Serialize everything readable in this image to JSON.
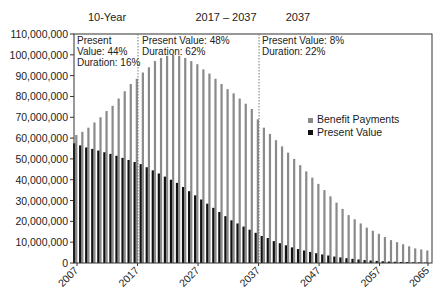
{
  "chart_data": {
    "type": "bar",
    "title": "",
    "xlabel": "",
    "ylabel": "",
    "ylim": [
      0,
      110000000
    ],
    "yticks": [
      0,
      10000000,
      20000000,
      30000000,
      40000000,
      50000000,
      60000000,
      70000000,
      80000000,
      90000000,
      100000000,
      110000000
    ],
    "ytick_labels": [
      "0",
      "10,000,000",
      "20,000,000",
      "30,000,000",
      "40,000,000",
      "50,000,000",
      "60,000,000",
      "70,000,000",
      "80,000,000",
      "90,000,000",
      "100,000,000",
      "110,000,000"
    ],
    "xtick_labels": [
      "2007",
      "2017",
      "2027",
      "2037",
      "2047",
      "2057",
      "2065"
    ],
    "grid": false,
    "legend_position": "right-middle",
    "categories": [
      2007,
      2008,
      2009,
      2010,
      2011,
      2012,
      2013,
      2014,
      2015,
      2016,
      2017,
      2018,
      2019,
      2020,
      2021,
      2022,
      2023,
      2024,
      2025,
      2026,
      2027,
      2028,
      2029,
      2030,
      2031,
      2032,
      2033,
      2034,
      2035,
      2036,
      2037,
      2038,
      2039,
      2040,
      2041,
      2042,
      2043,
      2044,
      2045,
      2046,
      2047,
      2048,
      2049,
      2050,
      2051,
      2052,
      2053,
      2054,
      2055,
      2056,
      2057,
      2058,
      2059,
      2060,
      2061,
      2062,
      2063,
      2064,
      2065
    ],
    "series": [
      {
        "name": "Benefit Payments",
        "color": "#8a8a8a",
        "values": [
          61500000,
          63000000,
          65000000,
          67500000,
          70000000,
          73000000,
          75500000,
          79000000,
          82500000,
          86000000,
          88500000,
          91500000,
          94000000,
          97000000,
          98500000,
          99500000,
          100000000,
          99500000,
          98500000,
          97000000,
          95500000,
          93000000,
          91000000,
          88500000,
          86000000,
          83500000,
          81500000,
          79000000,
          76500000,
          74000000,
          69000000,
          65000000,
          62000000,
          59000000,
          56000000,
          53000000,
          50000000,
          47000000,
          44000000,
          41000000,
          38000000,
          35000000,
          32000000,
          29000000,
          26000000,
          23000000,
          21000000,
          19000000,
          17000000,
          15500000,
          14000000,
          12500000,
          11000000,
          10000000,
          9000000,
          8000000,
          7000000,
          6500000,
          6000000
        ]
      },
      {
        "name": "Present Value",
        "color": "#111111",
        "values": [
          57500000,
          56500000,
          55500000,
          54800000,
          54000000,
          53200000,
          52400000,
          51500000,
          50500000,
          49500000,
          48500000,
          47500000,
          46000000,
          44500000,
          43000000,
          41500000,
          40000000,
          38500000,
          36500000,
          34500000,
          32500000,
          30500000,
          28500000,
          26500000,
          24500000,
          22500000,
          20500000,
          19000000,
          17500000,
          16000000,
          14500000,
          13000000,
          12000000,
          10500000,
          9500000,
          8500000,
          7500000,
          6700000,
          6000000,
          5300000,
          4700000,
          4100000,
          3600000,
          3100000,
          2700000,
          2300000,
          2000000,
          1700000,
          1400000,
          1200000,
          1000000,
          850000,
          700000,
          600000,
          500000,
          400000,
          320000,
          260000,
          200000
        ]
      }
    ],
    "annotations": [
      {
        "text": "Present Value: 44% Duration: 16%",
        "period": "10-Year"
      },
      {
        "text": "Present Value: 48% Duration: 62%",
        "period": "2017 – 2037"
      },
      {
        "text": "Present Value: 8% Duration: 22%",
        "period": "2037"
      }
    ],
    "dividers": [
      2017,
      2037
    ]
  },
  "headers": {
    "h1": "10-Year",
    "h2": "2017 – 2037",
    "h3": "2037"
  },
  "annotations": {
    "a1": [
      "Present",
      "Value: 44%",
      "Duration: 16%"
    ],
    "a2": [
      "Present Value: 48%",
      "Duration: 62%"
    ],
    "a3": [
      "Present Value: 8%",
      "Duration: 22%"
    ]
  },
  "legend": {
    "benefit": "Benefit Payments",
    "present": "Present Value"
  }
}
